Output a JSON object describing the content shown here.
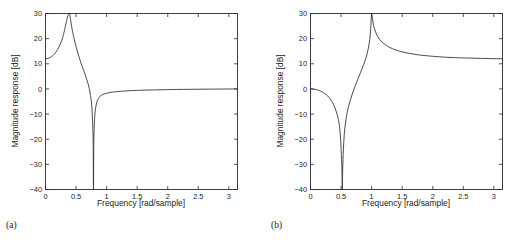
{
  "figure": {
    "panels": [
      {
        "caption": "(a)",
        "xlabel": "Frequency [rad/sample]",
        "ylabel": "Magnitude response [dB]"
      },
      {
        "caption": "(b)",
        "xlabel": "Frequency [rad/sample]",
        "ylabel": "Magnitude response [dB]"
      }
    ],
    "line_color": "#2b2b2b",
    "axis_color": "#2b2b2b",
    "background_color": "#ffffff"
  },
  "chart_data": [
    {
      "type": "line",
      "title": "",
      "subtitle": "(a)",
      "xlabel": "Frequency [rad/sample]",
      "ylabel": "Magnitude response [dB]",
      "xlim": [
        0,
        3.1416
      ],
      "ylim": [
        -40,
        30
      ],
      "xticks": [
        0,
        0.5,
        1,
        1.5,
        2,
        2.5,
        3
      ],
      "xticklabels": [
        "0",
        "0.5",
        "1",
        "1.5",
        "2",
        "2.5",
        "3"
      ],
      "yticks": [
        -40,
        -30,
        -20,
        -10,
        0,
        10,
        20,
        30
      ],
      "yticklabels": [
        "-40",
        "-30",
        "-20",
        "-10",
        "0",
        "10",
        "20",
        "30"
      ],
      "grid": false,
      "legend": null,
      "annotations": [
        {
          "text": "resonant peak clipped at 30 dB",
          "x": 0.393,
          "y": 30
        },
        {
          "text": "notch to -40 dB (below axis)",
          "x": 0.785,
          "y": -40
        },
        {
          "text": "value at DC",
          "x": 0,
          "y": 12
        }
      ],
      "series": [
        {
          "name": "magnitude response a",
          "x": [
            0,
            0.05,
            0.1,
            0.15,
            0.2,
            0.25,
            0.28,
            0.31,
            0.34,
            0.36,
            0.375,
            0.385,
            0.393,
            0.4,
            0.41,
            0.43,
            0.46,
            0.5,
            0.55,
            0.6,
            0.65,
            0.7,
            0.73,
            0.755,
            0.77,
            0.78,
            0.785,
            0.79,
            0.8,
            0.815,
            0.84,
            0.87,
            0.91,
            0.96,
            1.02,
            1.1,
            1.2,
            1.3,
            1.45,
            1.6,
            1.8,
            2.0,
            2.2,
            2.45,
            2.7,
            2.95,
            3.1416
          ],
          "y": [
            12.0,
            12.2,
            12.9,
            14.0,
            15.7,
            18.3,
            20.4,
            23.2,
            26.5,
            28.6,
            29.6,
            30.0,
            30.0,
            29.3,
            27.6,
            24.5,
            20.8,
            16.8,
            12.6,
            9.0,
            5.6,
            1.8,
            -1.6,
            -6.0,
            -13.0,
            -22.0,
            -40.0,
            -22.5,
            -13.5,
            -8.5,
            -5.3,
            -3.6,
            -2.6,
            -2.0,
            -1.6,
            -1.25,
            -1.0,
            -0.82,
            -0.63,
            -0.5,
            -0.37,
            -0.27,
            -0.2,
            -0.13,
            -0.08,
            -0.03,
            0.0
          ]
        }
      ]
    },
    {
      "type": "line",
      "title": "",
      "subtitle": "(b)",
      "xlabel": "Frequency [rad/sample]",
      "ylabel": "Magnitude response [dB]",
      "xlim": [
        0,
        3.1416
      ],
      "ylim": [
        -40,
        30
      ],
      "xticks": [
        0,
        0.5,
        1,
        1.5,
        2,
        2.5,
        3
      ],
      "xticklabels": [
        "0",
        "0.5",
        "1",
        "1.5",
        "2",
        "2.5",
        "3"
      ],
      "yticks": [
        -40,
        -30,
        -20,
        -10,
        0,
        10,
        20,
        30
      ],
      "yticklabels": [
        "-40",
        "-30",
        "-20",
        "-10",
        "0",
        "10",
        "20",
        "30"
      ],
      "grid": false,
      "legend": null,
      "annotations": [
        {
          "text": "value at DC",
          "x": 0,
          "y": 0
        },
        {
          "text": "notch to -40 dB",
          "x": 0.52,
          "y": -40
        },
        {
          "text": "resonant peak 30 dB",
          "x": 0.99,
          "y": 30
        },
        {
          "text": "high frequency asymptote",
          "x": 3.1416,
          "y": 12
        }
      ],
      "series": [
        {
          "name": "magnitude response b",
          "x": [
            0,
            0.05,
            0.1,
            0.15,
            0.2,
            0.25,
            0.3,
            0.34,
            0.38,
            0.42,
            0.45,
            0.475,
            0.495,
            0.508,
            0.515,
            0.52,
            0.525,
            0.535,
            0.55,
            0.57,
            0.6,
            0.64,
            0.68,
            0.72,
            0.77,
            0.82,
            0.87,
            0.91,
            0.945,
            0.97,
            0.985,
            0.995,
            1.0,
            1.01,
            1.03,
            1.06,
            1.1,
            1.16,
            1.24,
            1.34,
            1.46,
            1.6,
            1.75,
            1.9,
            2.1,
            2.3,
            2.55,
            2.8,
            3.0,
            3.1416
          ],
          "y": [
            0.0,
            -0.1,
            -0.3,
            -0.7,
            -1.3,
            -2.1,
            -3.3,
            -4.6,
            -6.3,
            -8.9,
            -11.5,
            -15.0,
            -21.0,
            -28.0,
            -33.0,
            -40.0,
            -33.5,
            -26.0,
            -19.0,
            -14.0,
            -9.3,
            -5.4,
            -2.3,
            0.5,
            3.6,
            6.6,
            9.7,
            12.6,
            16.0,
            19.8,
            24.0,
            28.3,
            30.0,
            28.5,
            25.5,
            23.0,
            20.8,
            18.9,
            17.3,
            16.0,
            15.0,
            14.2,
            13.6,
            13.2,
            12.8,
            12.5,
            12.3,
            12.15,
            12.05,
            12.0
          ]
        }
      ]
    }
  ]
}
